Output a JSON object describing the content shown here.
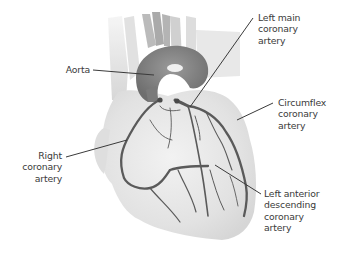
{
  "diagram": {
    "colors": {
      "background": "#ffffff",
      "heart_fill": "#e8e8e8",
      "aorta_fill": "#8c8c8c",
      "artery": "#5a5a5a",
      "leader_line": "#3a3a3a",
      "label_text": "#3a3a3a"
    },
    "labels": {
      "aorta": {
        "lines": [
          "Aorta"
        ]
      },
      "left_main": {
        "lines": [
          "Left main",
          "coronary",
          "artery"
        ]
      },
      "circumflex": {
        "lines": [
          "Circumflex",
          "coronary",
          "artery"
        ]
      },
      "right_coronary": {
        "lines": [
          "Right",
          "coronary",
          "artery"
        ]
      },
      "lad": {
        "lines": [
          "Left anterior",
          "descending",
          "coronary",
          "artery"
        ]
      }
    }
  }
}
